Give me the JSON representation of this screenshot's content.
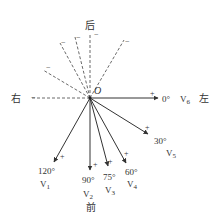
{
  "diagram": {
    "origin_label": "O",
    "direction_labels": {
      "back": "后",
      "front": "前",
      "right": "右",
      "left": "左"
    },
    "leads": [
      {
        "id": "V1",
        "name": "V",
        "sub": "1",
        "angle": "120°",
        "polarity": "+"
      },
      {
        "id": "V2",
        "name": "V",
        "sub": "2",
        "angle": "90°",
        "polarity": "+"
      },
      {
        "id": "V3",
        "name": "V",
        "sub": "3",
        "angle": "75°",
        "polarity": "+"
      },
      {
        "id": "V4",
        "name": "V",
        "sub": "4",
        "angle": "60°",
        "polarity": "+"
      },
      {
        "id": "V5",
        "name": "V",
        "sub": "5",
        "angle": "30°",
        "polarity": "+"
      },
      {
        "id": "V6",
        "name": "V",
        "sub": "6",
        "angle": "0°",
        "polarity": "+"
      }
    ],
    "negative_sign": "−",
    "colors": {
      "line": "#333333",
      "text": "#333333",
      "background": "#ffffff"
    }
  }
}
